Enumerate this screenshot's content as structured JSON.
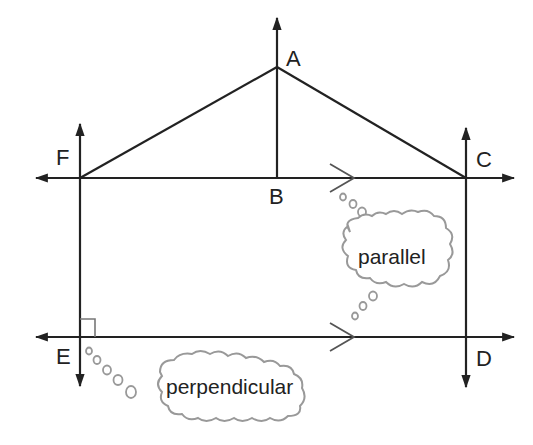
{
  "diagram": {
    "points": {
      "A": "A",
      "B": "B",
      "C": "C",
      "D": "D",
      "E": "E",
      "F": "F"
    },
    "callouts": {
      "parallel": "parallel",
      "perpendicular": "perpendicular"
    },
    "colors": {
      "line": "#222222",
      "cloud": "#999999",
      "background": "#ffffff"
    }
  }
}
